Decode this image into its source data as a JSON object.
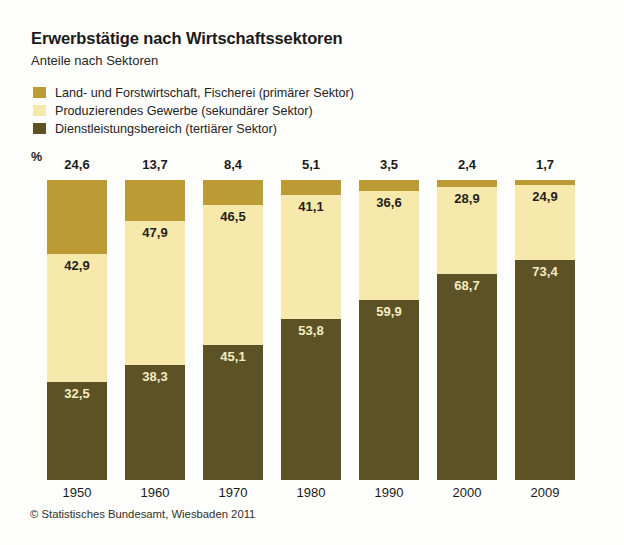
{
  "header": {
    "title": "Erwerbstätige nach Wirtschaftssektoren",
    "subtitle": "Anteile nach Sektoren"
  },
  "legend": {
    "items": [
      {
        "label": "Land- und Forstwirtschaft, Fischerei (primärer Sektor)",
        "color": "#bd9b34",
        "key": "primary"
      },
      {
        "label": "Produzierendes Gewerbe (sekundärer Sektor)",
        "color": "#f7e8ac",
        "key": "secondary"
      },
      {
        "label": "Dienstleistungsbereich (tertiärer Sektor)",
        "color": "#5c5226",
        "key": "tertiary"
      }
    ]
  },
  "axis": {
    "unit": "%"
  },
  "footer": {
    "source": "© Statistisches Bundesamt, Wiesbaden 2011"
  },
  "chart_data": {
    "type": "bar",
    "stacked": true,
    "stack_total": 100,
    "title": "Erwerbstätige nach Wirtschaftssektoren",
    "subtitle": "Anteile nach Sektoren",
    "xlabel": "",
    "ylabel": "%",
    "ylim": [
      0,
      100
    ],
    "grid": false,
    "legend_position": "top-left",
    "categories": [
      "1950",
      "1960",
      "1970",
      "1980",
      "1990",
      "2000",
      "2009"
    ],
    "series": [
      {
        "name": "Land- und Forstwirtschaft, Fischerei (primärer Sektor)",
        "key": "primary",
        "color": "#bd9b34",
        "label_position": "above-bar",
        "values": [
          24.6,
          13.7,
          8.4,
          5.1,
          3.5,
          2.4,
          1.7
        ],
        "value_labels": [
          "24,6",
          "13,7",
          "8,4",
          "5,1",
          "3,5",
          "2,4",
          "1,7"
        ]
      },
      {
        "name": "Produzierendes Gewerbe (sekundärer Sektor)",
        "key": "secondary",
        "color": "#f7e8ac",
        "label_position": "in-segment",
        "values": [
          42.9,
          47.9,
          46.5,
          41.1,
          36.6,
          28.9,
          24.9
        ],
        "value_labels": [
          "42,9",
          "47,9",
          "46,5",
          "41,1",
          "36,6",
          "28,9",
          "24,9"
        ]
      },
      {
        "name": "Dienstleistungsbereich (tertiärer Sektor)",
        "key": "tertiary",
        "color": "#5c5226",
        "label_position": "in-segment",
        "values": [
          32.5,
          38.3,
          45.1,
          53.8,
          59.9,
          68.7,
          73.4
        ],
        "value_labels": [
          "32,5",
          "38,3",
          "45,1",
          "53,8",
          "59,9",
          "68,7",
          "73,4"
        ]
      }
    ],
    "source": "© Statistisches Bundesamt, Wiesbaden 2011"
  }
}
